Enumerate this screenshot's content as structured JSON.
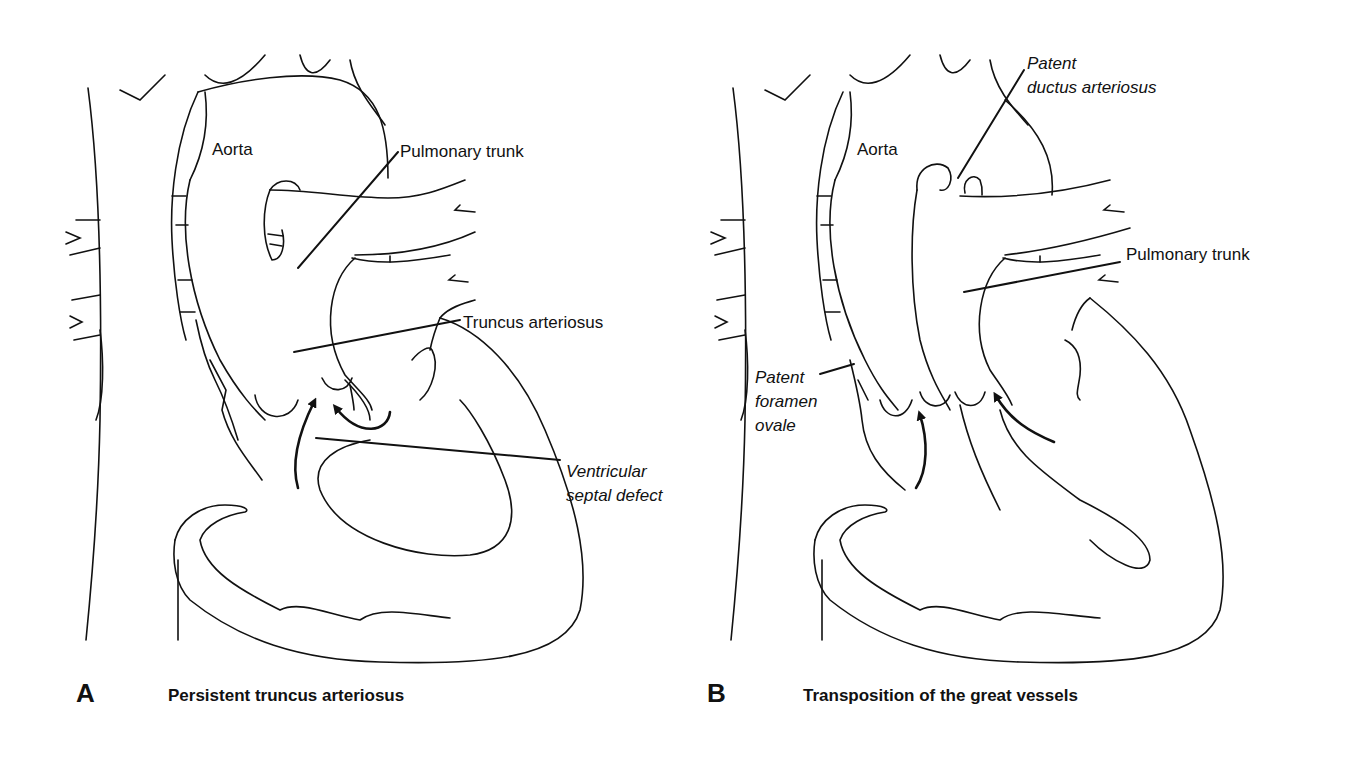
{
  "panels": [
    {
      "letter": "A",
      "caption": "Persistent truncus arteriosus",
      "labels": {
        "aorta": "Aorta",
        "pulmonary_trunk": "Pulmonary trunk",
        "truncus_arteriosus": "Truncus arteriosus",
        "vsd_line1": "Ventricular",
        "vsd_line2": "septal defect"
      }
    },
    {
      "letter": "B",
      "caption": "Transposition of the great vessels",
      "labels": {
        "aorta": "Aorta",
        "pda_line1": "Patent",
        "pda_line2": "ductus arteriosus",
        "pulmonary_trunk": "Pulmonary trunk",
        "pfo_line1": "Patent",
        "pfo_line2": "foramen",
        "pfo_line3": "ovale"
      }
    }
  ],
  "colors": {
    "ink": "#111111",
    "background": "#ffffff"
  }
}
